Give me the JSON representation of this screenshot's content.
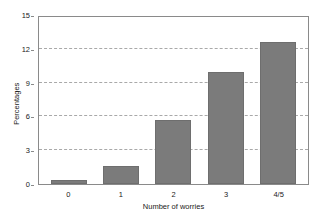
{
  "chart_data": {
    "type": "bar",
    "title": "",
    "xlabel": "Number of worries",
    "ylabel": "Percentages",
    "categories": [
      "0",
      "1",
      "2",
      "3",
      "4/5"
    ],
    "values": [
      0.4,
      1.6,
      5.7,
      9.9,
      12.6
    ],
    "yticks": [
      0,
      3,
      6,
      9,
      12,
      15
    ],
    "ylim": [
      0,
      15
    ],
    "grid": "horizontal-dashed",
    "legend": "none",
    "bar_color": "#7b7b7b",
    "grid_color": "#a9a9a9",
    "axis_color": "#8a8a8a"
  }
}
